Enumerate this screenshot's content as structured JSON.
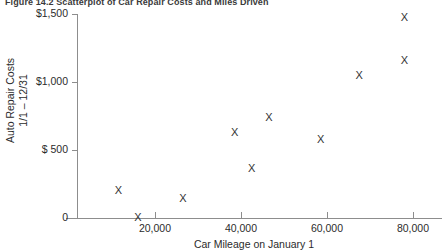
{
  "figure": {
    "title": "Figure 14.2   Scatterplot of Car Repair Costs and Miles Driven"
  },
  "chart_data": {
    "type": "scatter",
    "title": "Figure 14.2   Scatterplot of Car Repair Costs and Miles Driven",
    "xlabel": "Car Mileage on January 1",
    "ylabel": "Auto Repair Costs 1/1 – 12/31",
    "ylabel_line1": "Auto Repair Costs",
    "ylabel_line2": "1/1 – 12/31",
    "marker": "X",
    "marker_color": "#333333",
    "grid": false,
    "legend": false,
    "xlim": [
      0,
      90000
    ],
    "ylim": [
      0,
      1500
    ],
    "xticks": [
      20000,
      40000,
      60000,
      80000
    ],
    "xtick_labels": [
      "20,000",
      "40,000",
      "60,000",
      "80,000"
    ],
    "yticks": [
      0,
      500,
      1000,
      1500
    ],
    "ytick_labels": [
      "0",
      "$ 500",
      "$1,000",
      "$1,500"
    ],
    "x": [
      11500,
      16000,
      26500,
      38500,
      42500,
      46500,
      58500,
      67500,
      78000,
      78000
    ],
    "y": [
      205,
      10,
      150,
      630,
      370,
      740,
      580,
      1050,
      1480,
      1160
    ],
    "points": [
      {
        "x": 11500,
        "y": 205
      },
      {
        "x": 16000,
        "y": 10
      },
      {
        "x": 26500,
        "y": 150
      },
      {
        "x": 38500,
        "y": 630
      },
      {
        "x": 42500,
        "y": 370
      },
      {
        "x": 46500,
        "y": 740
      },
      {
        "x": 58500,
        "y": 580
      },
      {
        "x": 67500,
        "y": 1050
      },
      {
        "x": 78000,
        "y": 1480
      },
      {
        "x": 78000,
        "y": 1160
      }
    ]
  }
}
